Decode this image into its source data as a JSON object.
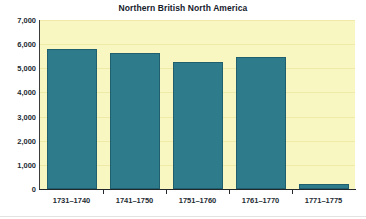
{
  "chart_data": {
    "type": "bar",
    "title": "Northern British North America",
    "xlabel": "",
    "ylabel": "",
    "categories": [
      "1731–1740",
      "1741–1750",
      "1751–1760",
      "1761–1770",
      "1771–1775"
    ],
    "values": [
      5800,
      5620,
      5250,
      5470,
      200
    ],
    "ylim": [
      0,
      7000
    ],
    "ytick_labels": [
      "7,000",
      "6,000",
      "5,000",
      "4,000",
      "3,000",
      "2,000",
      "1,000",
      "0"
    ],
    "ytick_values": [
      7000,
      6000,
      5000,
      4000,
      3000,
      2000,
      1000,
      0
    ],
    "grid": true,
    "legend": false,
    "colors": {
      "bar": "#2e7b8c",
      "bar_border": "#1f5f6e",
      "plot_background": "#f8f6c1",
      "gridline": "#efeaa8",
      "axis": "#23282c",
      "text": "#1d2b33",
      "page_background": "#ffffff"
    }
  }
}
